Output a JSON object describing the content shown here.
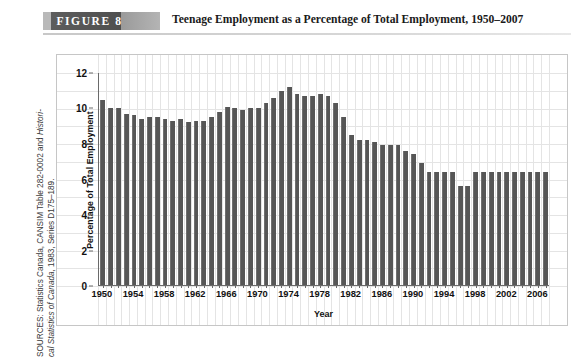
{
  "figure": {
    "badge_label": "FIGURE   8",
    "title": "Teenage Employment as a Percentage of Total Employment, 1950–2007"
  },
  "source": {
    "line1": "SOURCES: Statistics Canada, CANSIM Table 282-0002 and ",
    "line1_italic": "Histori-",
    "line2_italic": "cal Statistics of Canada",
    "line2": ", 1983, Series D175–189."
  },
  "colors": {
    "bar": "#565656",
    "axis": "#6a6a6a",
    "grid": "#e4e4e4",
    "badge": "#4f4f4f",
    "frame": "#c6c6c6"
  },
  "chart_data": {
    "type": "bar",
    "title": "Teenage Employment as a Percentage of Total Employment, 1950–2007",
    "xlabel": "Year",
    "ylabel": "Percentage of Total Employment",
    "ylim": [
      0,
      12
    ],
    "yticks": [
      0,
      2,
      4,
      6,
      8,
      10,
      12
    ],
    "ytick_labels": [
      "0",
      "2",
      "4",
      "6",
      "8",
      "10",
      "12"
    ],
    "xtick_labels": [
      "1950",
      "1954",
      "1958",
      "1962",
      "1966",
      "1970",
      "1974",
      "1978",
      "1982",
      "1986",
      "1990",
      "1994",
      "1998",
      "2002",
      "2006"
    ],
    "xtick_step": 4,
    "grid": true,
    "legend": null,
    "categories": [
      "1950",
      "1951",
      "1952",
      "1953",
      "1954",
      "1955",
      "1956",
      "1957",
      "1958",
      "1959",
      "1960",
      "1961",
      "1962",
      "1963",
      "1964",
      "1965",
      "1966",
      "1967",
      "1968",
      "1969",
      "1970",
      "1971",
      "1972",
      "1973",
      "1974",
      "1975",
      "1976",
      "1977",
      "1978",
      "1979",
      "1980",
      "1981",
      "1982",
      "1983",
      "1984",
      "1985",
      "1986",
      "1987",
      "1988",
      "1989",
      "1990",
      "1991",
      "1992",
      "1993",
      "1994",
      "1995",
      "1996",
      "1997",
      "1998",
      "1999",
      "2000",
      "2001",
      "2002",
      "2003",
      "2004",
      "2005",
      "2006",
      "2007"
    ],
    "values": [
      10.5,
      10.0,
      10.0,
      9.7,
      9.6,
      9.4,
      9.5,
      9.5,
      9.4,
      9.3,
      9.4,
      9.2,
      9.3,
      9.3,
      9.5,
      9.8,
      10.1,
      10.0,
      9.9,
      10.0,
      10.0,
      10.3,
      10.6,
      11.0,
      11.2,
      10.8,
      10.7,
      10.7,
      10.8,
      10.7,
      10.3,
      9.5,
      8.5,
      8.2,
      8.2,
      8.1,
      7.9,
      7.9,
      7.9,
      7.6,
      7.4,
      6.9,
      6.4,
      6.4,
      6.4,
      6.4,
      5.6,
      5.6,
      6.4,
      6.4,
      6.4,
      6.4,
      6.4,
      6.4,
      6.4,
      6.4,
      6.4,
      6.4
    ]
  }
}
